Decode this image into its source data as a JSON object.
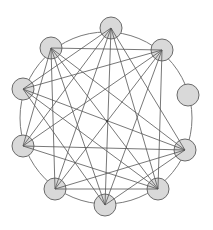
{
  "diagram": {
    "type": "graph",
    "title": "",
    "canvas": {
      "width": 213,
      "height": 230
    },
    "colors": {
      "background": "#ffffff",
      "node_fill": "#d9d9d9",
      "node_stroke": "#6a6a6a",
      "edge": "#555555",
      "ring": "#7a7a7a"
    },
    "ring": {
      "cx": 106,
      "cy": 118,
      "r": 86
    },
    "node_radius": 11,
    "nodes": [
      {
        "id": "top",
        "x": 111,
        "y": 28
      },
      {
        "id": "upper-left",
        "x": 51,
        "y": 48
      },
      {
        "id": "upper-right",
        "x": 162,
        "y": 50
      },
      {
        "id": "left-upper",
        "x": 23,
        "y": 89
      },
      {
        "id": "right",
        "x": 188,
        "y": 95
      },
      {
        "id": "left-lower",
        "x": 23,
        "y": 146
      },
      {
        "id": "right-lower",
        "x": 185,
        "y": 150
      },
      {
        "id": "bottom-left",
        "x": 55,
        "y": 189
      },
      {
        "id": "bottom-right",
        "x": 158,
        "y": 189
      },
      {
        "id": "bottom",
        "x": 105,
        "y": 205
      }
    ],
    "edges": [
      [
        "top",
        "left-upper"
      ],
      [
        "top",
        "left-lower"
      ],
      [
        "top",
        "bottom-left"
      ],
      [
        "top",
        "bottom"
      ],
      [
        "top",
        "bottom-right"
      ],
      [
        "top",
        "right-lower"
      ],
      [
        "upper-left",
        "upper-right"
      ],
      [
        "upper-left",
        "left-lower"
      ],
      [
        "upper-left",
        "bottom-left"
      ],
      [
        "upper-left",
        "bottom"
      ],
      [
        "upper-left",
        "bottom-right"
      ],
      [
        "upper-left",
        "right-lower"
      ],
      [
        "upper-right",
        "left-upper"
      ],
      [
        "upper-right",
        "left-lower"
      ],
      [
        "upper-right",
        "bottom-left"
      ],
      [
        "upper-right",
        "bottom"
      ],
      [
        "upper-right",
        "bottom-right"
      ],
      [
        "left-upper",
        "right-lower"
      ],
      [
        "left-upper",
        "bottom-right"
      ],
      [
        "left-upper",
        "bottom"
      ],
      [
        "left-lower",
        "right-lower"
      ],
      [
        "left-lower",
        "bottom-right"
      ],
      [
        "bottom-left",
        "bottom-right"
      ],
      [
        "bottom-left",
        "right-lower"
      ],
      [
        "bottom",
        "right-lower"
      ]
    ],
    "center_dot": {
      "x": 107,
      "y": 121,
      "r": 1.2
    }
  }
}
